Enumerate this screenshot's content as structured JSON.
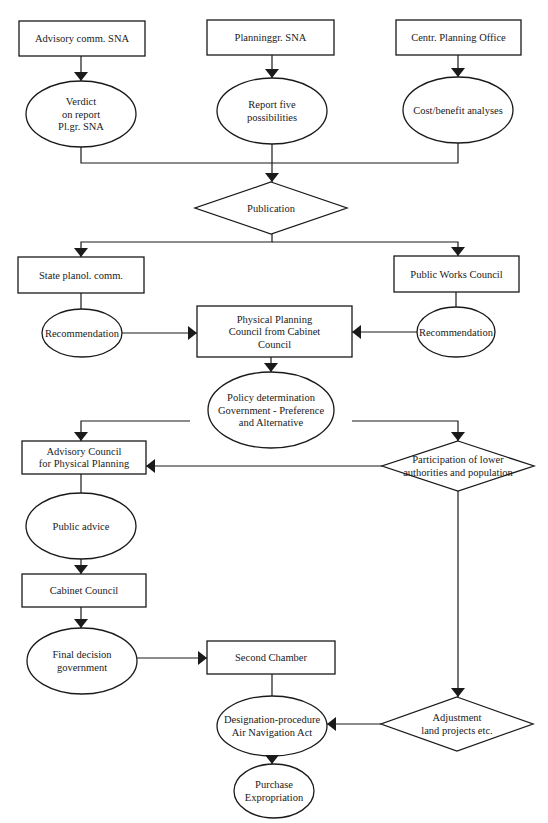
{
  "diagram": {
    "type": "flowchart",
    "colors": {
      "stroke": "#1a1a1a",
      "fill": "#ffffff",
      "background": "#ffffff"
    },
    "nodes": [
      {
        "id": "advisory-comm-sna",
        "shape": "rect",
        "x": 19,
        "y": 21,
        "w": 126,
        "h": 35,
        "lines": [
          "Advisory comm. SNA"
        ]
      },
      {
        "id": "planninggr-sna",
        "shape": "rect",
        "x": 207,
        "y": 20,
        "w": 127,
        "h": 35,
        "lines": [
          "Planninggr. SNA"
        ]
      },
      {
        "id": "centr-planning-office",
        "shape": "rect",
        "x": 396,
        "y": 20,
        "w": 125,
        "h": 35,
        "lines": [
          "Centr. Planning Office"
        ]
      },
      {
        "id": "verdict-on-report",
        "shape": "ellipse",
        "cx": 81,
        "cy": 114,
        "rx": 55,
        "ry": 33,
        "lines": [
          "Verdict",
          "on report",
          "Pl.gr. SNA"
        ]
      },
      {
        "id": "report-five-possibilities",
        "shape": "ellipse",
        "cx": 272,
        "cy": 111,
        "rx": 55,
        "ry": 33,
        "lines": [
          "Report five",
          "possibilities"
        ]
      },
      {
        "id": "cost-benefit-analyses",
        "shape": "ellipse",
        "cx": 458,
        "cy": 110,
        "rx": 55,
        "ry": 33,
        "lines": [
          "Cost/benefit analyses"
        ]
      },
      {
        "id": "publication",
        "shape": "diamond",
        "cx": 271,
        "cy": 208,
        "hw": 76,
        "hh": 26,
        "lines": [
          "Publication"
        ]
      },
      {
        "id": "state-planol-comm",
        "shape": "rect",
        "x": 18,
        "y": 257,
        "w": 126,
        "h": 36,
        "lines": [
          "State planol. comm."
        ]
      },
      {
        "id": "public-works-council",
        "shape": "rect",
        "x": 394,
        "y": 256,
        "w": 125,
        "h": 36,
        "lines": [
          "Public Works Council"
        ]
      },
      {
        "id": "recommendation-left",
        "shape": "ellipse",
        "cx": 82,
        "cy": 333,
        "rx": 40,
        "ry": 24,
        "lines": [
          "Recommendation"
        ]
      },
      {
        "id": "physical-planning-council",
        "shape": "rect",
        "x": 197,
        "y": 306,
        "w": 155,
        "h": 51,
        "lines": [
          "Physical Planning",
          "Council from Cabinet",
          "Council"
        ]
      },
      {
        "id": "recommendation-right",
        "shape": "ellipse",
        "cx": 456,
        "cy": 332,
        "rx": 39,
        "ry": 25,
        "lines": [
          "Recommendation"
        ]
      },
      {
        "id": "policy-determination",
        "shape": "ellipse",
        "cx": 271,
        "cy": 410,
        "rx": 63,
        "ry": 38,
        "lines": [
          "Policy determination",
          "Government - Preference",
          "and Alternative"
        ]
      },
      {
        "id": "advisory-council-physical-planning",
        "shape": "rect",
        "x": 22,
        "y": 441,
        "w": 124,
        "h": 33,
        "lines": [
          "Advisory Council",
          "for Physical Planning"
        ]
      },
      {
        "id": "participation-lower-authorities",
        "shape": "diamond",
        "cx": 458,
        "cy": 466,
        "hw": 76,
        "hh": 25,
        "lines": [
          "Participation of lower",
          "authorities and population"
        ]
      },
      {
        "id": "public-advice",
        "shape": "ellipse",
        "cx": 81,
        "cy": 526,
        "rx": 55,
        "ry": 33,
        "lines": [
          "Public advice"
        ]
      },
      {
        "id": "cabinet-council",
        "shape": "rect",
        "x": 22,
        "y": 574,
        "w": 124,
        "h": 33,
        "lines": [
          "Cabinet Council"
        ]
      },
      {
        "id": "final-decision-government",
        "shape": "ellipse",
        "cx": 82,
        "cy": 661,
        "rx": 55,
        "ry": 33,
        "lines": [
          "Final decision",
          "government"
        ]
      },
      {
        "id": "second-chamber",
        "shape": "rect",
        "x": 207,
        "y": 641,
        "w": 128,
        "h": 33,
        "lines": [
          "Second Chamber"
        ]
      },
      {
        "id": "designation-procedure",
        "shape": "ellipse",
        "cx": 272,
        "cy": 726,
        "rx": 55,
        "ry": 30,
        "lines": [
          "Designation-procedure",
          "Air Navigation Act"
        ]
      },
      {
        "id": "adjustment-land-projects",
        "shape": "diamond",
        "cx": 457,
        "cy": 724,
        "hw": 76,
        "hh": 27,
        "lines": [
          "Adjustment",
          "land projects etc."
        ]
      },
      {
        "id": "purchase-expropriation",
        "shape": "ellipse",
        "cx": 274,
        "cy": 791,
        "rx": 40,
        "ry": 27,
        "lines": [
          "Purchase",
          "Expropriation"
        ]
      }
    ],
    "edges": [
      {
        "from": "advisory-comm-sna",
        "to": "verdict-on-report",
        "points": [
          [
            81,
            56
          ],
          [
            81,
            81
          ]
        ],
        "arrow": "down"
      },
      {
        "from": "planninggr-sna",
        "to": "report-five-possibilities",
        "points": [
          [
            272,
            55
          ],
          [
            272,
            78
          ]
        ],
        "arrow": "down"
      },
      {
        "from": "centr-planning-office",
        "to": "cost-benefit-analyses",
        "points": [
          [
            458,
            55
          ],
          [
            458,
            77
          ]
        ],
        "arrow": "down"
      },
      {
        "from": "verdict-on-report",
        "to": "publication",
        "points": [
          [
            81,
            147
          ],
          [
            81,
            163
          ],
          [
            272,
            163
          ]
        ],
        "arrow": null
      },
      {
        "from": "cost-benefit-analyses",
        "to": "publication",
        "points": [
          [
            458,
            143
          ],
          [
            458,
            163
          ],
          [
            272,
            163
          ]
        ],
        "arrow": null
      },
      {
        "from": "report-five-possibilities",
        "to": "publication",
        "points": [
          [
            272,
            144
          ],
          [
            272,
            182
          ]
        ],
        "arrow": "down"
      },
      {
        "from": "publication",
        "to": "state-planol-comm",
        "points": [
          [
            272,
            234
          ],
          [
            272,
            242
          ],
          [
            81,
            242
          ],
          [
            81,
            257
          ]
        ],
        "arrow": "down"
      },
      {
        "from": "publication",
        "to": "public-works-council",
        "points": [
          [
            272,
            242
          ],
          [
            458,
            242
          ],
          [
            458,
            256
          ]
        ],
        "arrow": "down"
      },
      {
        "from": "state-planol-comm",
        "to": "recommendation-left",
        "points": [
          [
            81,
            293
          ],
          [
            81,
            309
          ]
        ],
        "arrow": null
      },
      {
        "from": "public-works-council",
        "to": "recommendation-right",
        "points": [
          [
            456,
            292
          ],
          [
            456,
            307
          ]
        ],
        "arrow": null
      },
      {
        "from": "recommendation-left",
        "to": "physical-planning-council",
        "points": [
          [
            122,
            333
          ],
          [
            197,
            333
          ]
        ],
        "arrow": "right"
      },
      {
        "from": "recommendation-right",
        "to": "physical-planning-council",
        "points": [
          [
            417,
            332
          ],
          [
            352,
            332
          ]
        ],
        "arrow": "left"
      },
      {
        "from": "physical-planning-council",
        "to": "policy-determination",
        "points": [
          [
            271,
            357
          ],
          [
            271,
            372
          ]
        ],
        "arrow": "down"
      },
      {
        "from": "policy-determination",
        "to": "advisory-council-physical-planning",
        "points": [
          [
            190,
            421
          ],
          [
            81,
            421
          ],
          [
            81,
            441
          ]
        ],
        "arrow": "down"
      },
      {
        "from": "policy-determination",
        "to": "participation-lower-authorities",
        "points": [
          [
            352,
            421
          ],
          [
            458,
            421
          ],
          [
            458,
            441
          ]
        ],
        "arrow": "down"
      },
      {
        "from": "participation-lower-authorities",
        "to": "advisory-council-physical-planning",
        "points": [
          [
            382,
            466
          ],
          [
            146,
            466
          ]
        ],
        "arrow": "left"
      },
      {
        "from": "advisory-council-physical-planning",
        "to": "public-advice",
        "points": [
          [
            81,
            474
          ],
          [
            81,
            493
          ]
        ],
        "arrow": null
      },
      {
        "from": "public-advice",
        "to": "cabinet-council",
        "points": [
          [
            81,
            559
          ],
          [
            81,
            574
          ]
        ],
        "arrow": "down"
      },
      {
        "from": "cabinet-council",
        "to": "final-decision-government",
        "points": [
          [
            81,
            607
          ],
          [
            81,
            628
          ]
        ],
        "arrow": "down"
      },
      {
        "from": "final-decision-government",
        "to": "second-chamber",
        "points": [
          [
            137,
            658
          ],
          [
            207,
            658
          ]
        ],
        "arrow": "right"
      },
      {
        "from": "second-chamber",
        "to": "designation-procedure",
        "points": [
          [
            272,
            674
          ],
          [
            272,
            696
          ]
        ],
        "arrow": null
      },
      {
        "from": "participation-lower-authorities",
        "to": "adjustment-land-projects",
        "points": [
          [
            458,
            491
          ],
          [
            458,
            697
          ]
        ],
        "arrow": "down"
      },
      {
        "from": "adjustment-land-projects",
        "to": "designation-procedure",
        "points": [
          [
            381,
            724
          ],
          [
            327,
            724
          ]
        ],
        "arrow": "left"
      },
      {
        "from": "designation-procedure",
        "to": "purchase-expropriation",
        "points": [
          [
            272,
            756
          ],
          [
            272,
            764
          ]
        ],
        "arrow": "down"
      }
    ]
  }
}
